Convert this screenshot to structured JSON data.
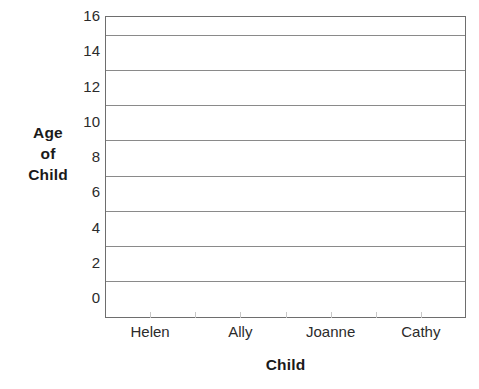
{
  "chart_data": {
    "type": "bar",
    "title": "",
    "subtitle": "",
    "xlabel": "Child",
    "ylabel": "Age of Child",
    "ylabel_lines": [
      "Age",
      "of",
      "Child"
    ],
    "categories": [
      "Helen",
      "Ally",
      "Joanne",
      "Cathy"
    ],
    "values": [
      null,
      null,
      null,
      null
    ],
    "series": [
      {
        "name": "Age of Child",
        "values": [
          null,
          null,
          null,
          null
        ]
      }
    ],
    "ylim": [
      0,
      16
    ],
    "y_tick_labels": [
      "0",
      "2",
      "4",
      "6",
      "8",
      "10",
      "12",
      "14",
      "16"
    ],
    "y_tick_values": [
      0,
      2,
      4,
      6,
      8,
      10,
      12,
      14,
      16
    ],
    "y_major_step": 2,
    "gridline_values": [
      1,
      3,
      5,
      7,
      9,
      11,
      13,
      15,
      16
    ],
    "grid": "horizontal",
    "legend": "none",
    "annotations": [],
    "note": "Blank worksheet axes — no bars plotted",
    "colors": {
      "background": "#ffffff",
      "axis": "#6e6e6e",
      "gridline": "#8a8a8a",
      "text": "#2b2b2b",
      "title_text": "#1a1a1a"
    }
  }
}
